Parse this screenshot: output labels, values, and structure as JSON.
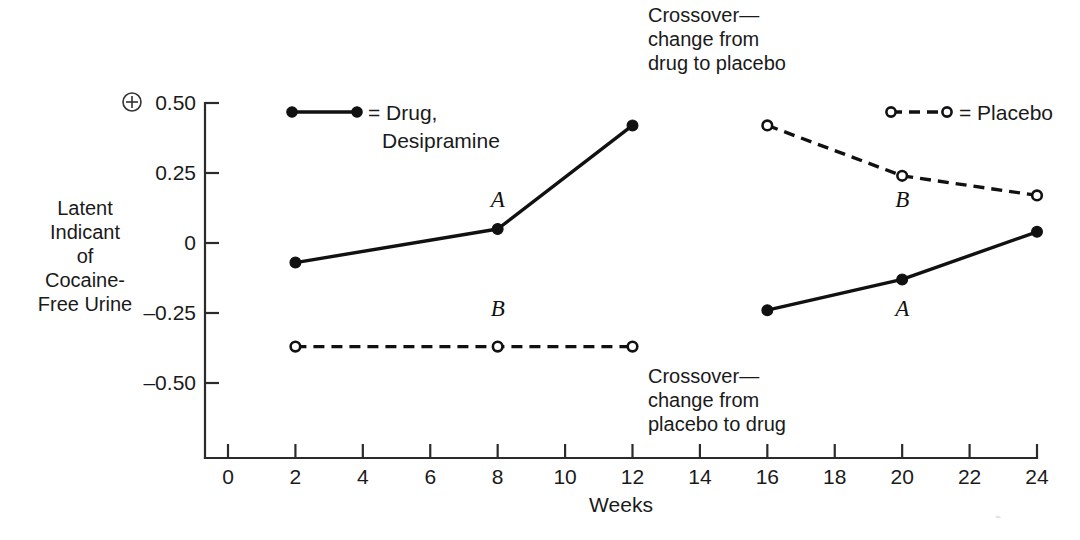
{
  "chart_data": {
    "type": "line",
    "title": "",
    "xlabel": "Weeks",
    "ylabel": "Latent Indicant of Cocaine-Free Urine",
    "ylabel_lines": [
      "Latent",
      "Indicant",
      "of",
      "Cocaine-",
      "Free Urine"
    ],
    "xlim": [
      0,
      24
    ],
    "ylim": [
      -0.62,
      0.5
    ],
    "grid": false,
    "xticks": [
      0,
      2,
      4,
      6,
      8,
      10,
      12,
      14,
      16,
      18,
      20,
      22,
      24
    ],
    "xtick_labels": [
      "0",
      "2",
      "4",
      "6",
      "8",
      "10",
      "12",
      "14",
      "16",
      "18",
      "20",
      "22",
      "24"
    ],
    "yticks": [
      0.5,
      0.25,
      0,
      -0.25,
      -0.5
    ],
    "ytick_labels": [
      "0.50",
      "0.25",
      "0",
      "–0.25",
      "–0.50"
    ],
    "y_axis_marker": "⊕",
    "legend_position": "top",
    "series": [
      {
        "name": "A-phase1-drug",
        "label": "A",
        "group": "Drug, Desipramine",
        "style": "solid",
        "marker": "filled-circle",
        "label_x": 8,
        "label_y": 0.13,
        "x": [
          2,
          8,
          12
        ],
        "values": [
          -0.07,
          0.05,
          0.42
        ]
      },
      {
        "name": "B-phase1-placebo",
        "label": "B",
        "group": "Placebo",
        "style": "dashed",
        "marker": "open-circle",
        "label_x": 8,
        "label_y": -0.26,
        "x": [
          2,
          8,
          12
        ],
        "values": [
          -0.37,
          -0.37,
          -0.37
        ]
      },
      {
        "name": "B-phase2-placebo",
        "label": "B",
        "group": "Placebo",
        "style": "dashed",
        "marker": "open-circle",
        "label_x": 20,
        "label_y": 0.13,
        "x": [
          16,
          20,
          24
        ],
        "values": [
          0.42,
          0.24,
          0.17
        ]
      },
      {
        "name": "A-phase2-drug",
        "label": "A",
        "group": "Drug, Desipramine",
        "style": "solid",
        "marker": "filled-circle",
        "label_x": 20,
        "label_y": -0.26,
        "x": [
          16,
          20,
          24
        ],
        "values": [
          -0.24,
          -0.13,
          0.04
        ]
      }
    ],
    "legend": [
      {
        "name": "legend-drug",
        "text": "= Drug,",
        "text2": "Desipramine",
        "style": "solid",
        "marker": "filled-circle"
      },
      {
        "name": "legend-placebo",
        "text": "= Placebo",
        "text2": "",
        "style": "dashed",
        "marker": "open-circle"
      }
    ],
    "annotations": [
      {
        "name": "crossover-drug-to-placebo",
        "lines": [
          "Crossover—",
          "change from",
          "drug to placebo"
        ],
        "x_px": 648,
        "y_px": 22
      },
      {
        "name": "crossover-placebo-to-drug",
        "lines": [
          "Crossover—",
          "change from",
          "placebo to drug"
        ],
        "x_px": 648,
        "y_px": 383
      }
    ]
  }
}
